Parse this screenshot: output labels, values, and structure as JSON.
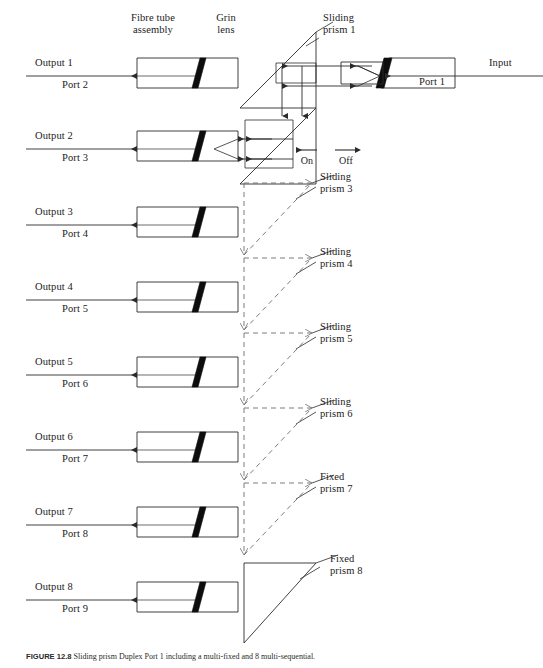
{
  "figure": {
    "type": "optical-switch-schematic",
    "caption_prefix": "FIGURE 12.8",
    "caption_text": "Sliding prism Duplex Port 1 including a multi-fixed and 8 multi-sequential."
  },
  "top_labels": {
    "fibre_tube": "Fibre tube\nassembly",
    "grin_lens": "Grin\nlens",
    "sliding_prism_1": "Sliding\nprism 1",
    "input": "Input"
  },
  "switch_state": {
    "on_label": "On",
    "off_label": "Off",
    "on_arrow": "left-arrow-icon",
    "off_arrow": "right-arrow-icon"
  },
  "input_port": {
    "label": "Port 1"
  },
  "outputs": [
    {
      "output": "Output 1",
      "port": "Port 2",
      "y": 73
    },
    {
      "output": "Output 2",
      "port": "Port 3",
      "y": 146
    },
    {
      "output": "Output 3",
      "port": "Port 4",
      "y": 222
    },
    {
      "output": "Output 4",
      "port": "Port 5",
      "y": 297
    },
    {
      "output": "Output 5",
      "port": "Port 6",
      "y": 372
    },
    {
      "output": "Output 6",
      "port": "Port 7",
      "y": 447
    },
    {
      "output": "Output 7",
      "port": "Port 8",
      "y": 522
    },
    {
      "output": "Output 8",
      "port": "Port 9",
      "y": 597
    }
  ],
  "prisms": [
    {
      "name": "Sliding\nprism 1",
      "kind": "sliding",
      "style": "solid",
      "y": 22
    },
    {
      "name": "Sliding\nprism 3",
      "kind": "sliding",
      "style": "dashed",
      "y": 183
    },
    {
      "name": "Sliding\nprism 4",
      "kind": "sliding",
      "style": "dashed",
      "y": 258
    },
    {
      "name": "Sliding\nprism 5",
      "kind": "sliding",
      "style": "dashed",
      "y": 333
    },
    {
      "name": "Sliding\nprism 6",
      "kind": "sliding",
      "style": "dashed",
      "y": 408
    },
    {
      "name": "Fixed\nprism 7",
      "kind": "fixed",
      "style": "dashed",
      "y": 483
    },
    {
      "name": "Fixed\nprism 8",
      "kind": "fixed",
      "style": "solid",
      "y": 563
    }
  ],
  "colors": {
    "line": "#2b2b2b",
    "dashed": "#6e6e6e",
    "grin_fill": "#0d0d0d",
    "text": "#1b1b1b",
    "background": "#ffffff"
  }
}
